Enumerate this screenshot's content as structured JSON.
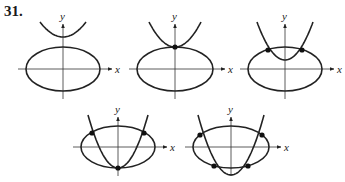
{
  "problem_number": "31.",
  "axis_labels": {
    "x": "x",
    "y": "y"
  },
  "colors": {
    "stroke": "#222222",
    "axis": "#333333",
    "point": "#111111"
  },
  "panels": [
    {
      "id": "panel-1",
      "description": "parabola above ellipse, no intersection",
      "intersections": 0,
      "origin": [
        63,
        69
      ],
      "ellipse": {
        "cx": 63,
        "cy": 69,
        "rx": 37,
        "ry": 22
      },
      "parabola": {
        "vertex": [
          63,
          37
        ],
        "left_top": [
          40,
          22
        ],
        "right_top": [
          86,
          22
        ]
      },
      "points": []
    },
    {
      "id": "panel-2",
      "description": "parabola tangent to top of ellipse, one intersection",
      "intersections": 1,
      "origin": [
        175,
        69
      ],
      "ellipse": {
        "cx": 175,
        "cy": 69,
        "rx": 38,
        "ry": 22
      },
      "parabola": {
        "vertex": [
          175,
          47
        ],
        "left_top": [
          149,
          22
        ],
        "right_top": [
          201,
          22
        ]
      },
      "points": [
        [
          175,
          47
        ]
      ]
    },
    {
      "id": "panel-3",
      "description": "parabola vertex inside ellipse, two intersections",
      "intersections": 2,
      "origin": [
        285,
        69
      ],
      "ellipse": {
        "cx": 285,
        "cy": 69,
        "rx": 37,
        "ry": 22
      },
      "parabola": {
        "vertex": [
          285,
          60
        ],
        "left_top": [
          257,
          22
        ],
        "right_top": [
          313,
          22
        ]
      },
      "points": [
        [
          268,
          50
        ],
        [
          302,
          50
        ]
      ]
    },
    {
      "id": "panel-4",
      "description": "parabola vertex at bottom of ellipse, three intersections",
      "intersections": 3,
      "origin": [
        118,
        147
      ],
      "ellipse": {
        "cx": 118,
        "cy": 147,
        "rx": 37,
        "ry": 21
      },
      "parabola": {
        "vertex": [
          118,
          168
        ],
        "left_top": [
          88,
          115
        ],
        "right_top": [
          148,
          115
        ]
      },
      "points": [
        [
          92,
          133
        ],
        [
          144,
          133
        ],
        [
          118,
          168
        ]
      ]
    },
    {
      "id": "panel-5",
      "description": "parabola vertex below ellipse, four intersections",
      "intersections": 4,
      "origin": [
        231,
        147
      ],
      "ellipse": {
        "cx": 231,
        "cy": 147,
        "rx": 38,
        "ry": 21
      },
      "parabola": {
        "vertex": [
          231,
          175
        ],
        "left_top": [
          198,
          115
        ],
        "right_top": [
          264,
          115
        ]
      },
      "points": [
        [
          200,
          135
        ],
        [
          262,
          135
        ],
        [
          214,
          166
        ],
        [
          248,
          166
        ]
      ]
    }
  ]
}
